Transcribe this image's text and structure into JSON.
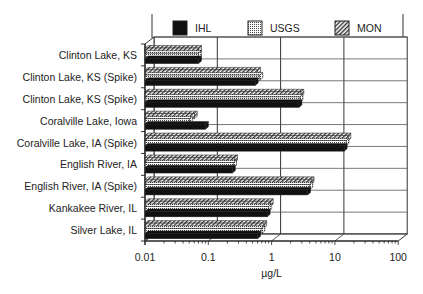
{
  "chart_data": {
    "type": "bar",
    "orientation": "horizontal",
    "title": "",
    "xlabel": "µg/L",
    "ylabel": "",
    "xscale": "log",
    "xlim": [
      0.01,
      100
    ],
    "xticks": [
      "0.01",
      "0.1",
      "1",
      "10",
      "100"
    ],
    "grid": true,
    "legend_position": "top",
    "categories": [
      "Clinton Lake, KS",
      "Clinton Lake, KS (Spike)",
      "Clinton Lake, KS (Spike)",
      "Coralville Lake, Iowa",
      "Coralville Lake, IA (Spike)",
      "English River, IA",
      "English River, IA (Spike)",
      "Kankakee River, IL",
      "Silver Lake, IL"
    ],
    "series": [
      {
        "name": "IHL",
        "pattern": "solid-black",
        "values": [
          0.07,
          0.55,
          2.7,
          0.09,
          14,
          0.24,
          3.7,
          0.85,
          0.6
        ]
      },
      {
        "name": "USGS",
        "pattern": "dotted-grid",
        "values": [
          0.07,
          0.65,
          2.8,
          0.05,
          15,
          0.25,
          4.0,
          0.9,
          0.7
        ]
      },
      {
        "name": "MON",
        "pattern": "diagonal-hatch",
        "values": [
          0.07,
          0.6,
          2.9,
          0.06,
          16,
          0.26,
          4.2,
          0.95,
          0.75
        ]
      }
    ]
  }
}
